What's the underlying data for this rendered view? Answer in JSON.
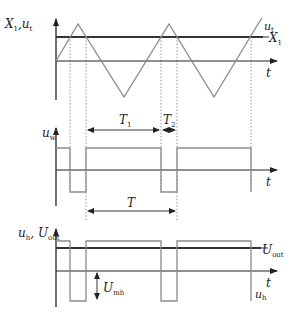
{
  "diagram": {
    "type": "timing-waveform",
    "colors": {
      "axis": "#222222",
      "signal": "#8c8c8c",
      "threshold": "#333333",
      "dotted": "#7a7a7a",
      "background": "#ffffff"
    },
    "panel_top": {
      "y_label": "X₁,uₜ",
      "y_label_main": "X",
      "y_label_sub1": "1",
      "y_label_sep": ",u",
      "y_label_sub2": "t",
      "x_label": "t",
      "series_triangle_label_main": "u",
      "series_triangle_label_sub": "t",
      "series_threshold_label_main": "X",
      "series_threshold_label_sub": "1"
    },
    "panel_middle": {
      "y_label_main": "u",
      "y_label_sub": "w",
      "x_label": "t",
      "interval_T1_main": "T",
      "interval_T1_sub": "1",
      "interval_T2_main": "T",
      "interval_T2_sub": "2",
      "interval_T": "T"
    },
    "panel_bottom": {
      "y_label_main1": "u",
      "y_label_sub1": "h",
      "y_label_sep": ", ",
      "y_label_main2": "U",
      "y_label_sub2": "out",
      "x_label": "t",
      "series_output_label_main": "U",
      "series_output_label_sub": "out",
      "series_pulse_label_main": "u",
      "series_pulse_label_sub": "h",
      "amplitude_label_main": "U",
      "amplitude_label_sub": "mh"
    }
  }
}
